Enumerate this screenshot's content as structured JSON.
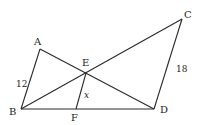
{
  "diagram": {
    "type": "geometry",
    "points": {
      "A": {
        "label": "A",
        "x": 40,
        "y": 49
      },
      "B": {
        "label": "B",
        "x": 21,
        "y": 109
      },
      "C": {
        "label": "C",
        "x": 182,
        "y": 19
      },
      "D": {
        "label": "D",
        "x": 154,
        "y": 109
      },
      "E": {
        "label": "E",
        "x": 86,
        "y": 73
      },
      "F": {
        "label": "F",
        "x": 76,
        "y": 109
      }
    },
    "segments": [
      [
        "A",
        "B"
      ],
      [
        "A",
        "D"
      ],
      [
        "B",
        "C"
      ],
      [
        "C",
        "D"
      ],
      [
        "B",
        "D"
      ],
      [
        "E",
        "F"
      ]
    ],
    "measures": {
      "AB": "12",
      "CD": "18",
      "EF": "x"
    }
  }
}
